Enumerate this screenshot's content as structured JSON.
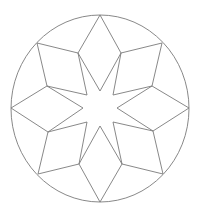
{
  "diagram": {
    "colors": {
      "background": "#ffffff",
      "stroke": "#7a7a7a"
    },
    "circle": {
      "cx": 100,
      "cy": 108.5,
      "rx": 89,
      "ry": 93.5
    },
    "rhombuses": [
      {
        "name": "north",
        "points": "100,15 121,53 100,91 78,53"
      },
      {
        "name": "northeast",
        "points": "162,43 152,86 113,95 121,53"
      },
      {
        "name": "east",
        "points": "189,108 153,131 117,108 152,86"
      },
      {
        "name": "southeast",
        "points": "163,174 122,164 113,122 153,131"
      },
      {
        "name": "south",
        "points": "100,202 79,164 100,126 122,164"
      },
      {
        "name": "southwest",
        "points": "38,174 48,132 87,122 79,164"
      },
      {
        "name": "west",
        "points": "11,108 47,86 83,108 48,132"
      },
      {
        "name": "northwest",
        "points": "37,43 78,53 87,95 47,86"
      }
    ]
  }
}
